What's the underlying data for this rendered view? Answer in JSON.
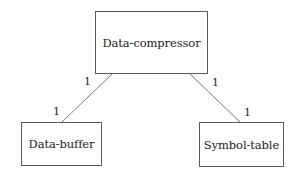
{
  "diagram": {
    "type": "class-association",
    "entities": [
      {
        "id": "data-compressor",
        "label": "Data-compressor"
      },
      {
        "id": "data-buffer",
        "label": "Data-buffer"
      },
      {
        "id": "symbol-table",
        "label": "Symbol-table"
      }
    ],
    "associations": [
      {
        "from": "data-compressor",
        "to": "data-buffer",
        "from_multiplicity": "1",
        "to_multiplicity": "1"
      },
      {
        "from": "data-compressor",
        "to": "symbol-table",
        "from_multiplicity": "1",
        "to_multiplicity": "1"
      }
    ],
    "colors": {
      "border": "#5a5a5a",
      "line": "#777777",
      "text": "#222222",
      "background": "#ffffff"
    }
  }
}
